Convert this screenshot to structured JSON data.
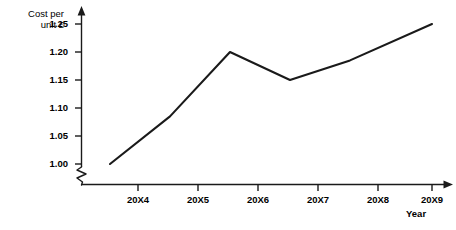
{
  "chart_data": {
    "type": "line",
    "title": "",
    "xlabel": "Year",
    "ylabel": "Cost per unit £",
    "ylabel_line1": "Cost per",
    "ylabel_line2": "unit £",
    "categories": [
      "20X4",
      "20X5",
      "20X6",
      "20X7",
      "20X8",
      "20X9"
    ],
    "values": [
      1.0,
      1.085,
      1.2,
      1.15,
      1.185,
      1.25
    ],
    "ytick_labels": [
      "1.25",
      "1.20",
      "1.15",
      "1.10",
      "1.05",
      "1.00"
    ],
    "ytick_values": [
      1.25,
      1.2,
      1.15,
      1.1,
      1.05,
      1.0
    ],
    "ylim": [
      1.0,
      1.25
    ],
    "y_axis_broken": true,
    "grid": false,
    "legend": false,
    "markers": false,
    "series": [
      {
        "name": "Cost per unit",
        "values": [
          1.0,
          1.085,
          1.2,
          1.15,
          1.185,
          1.25
        ]
      }
    ],
    "line_color": "#1a1a1a",
    "axis_color": "#1a1a1a"
  },
  "top_clipped_text": ""
}
